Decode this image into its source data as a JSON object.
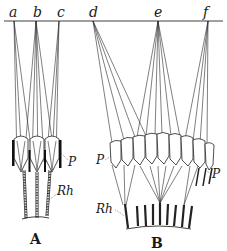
{
  "figure": {
    "type": "scientific-illustration",
    "point_labels": [
      "a",
      "b",
      "c",
      "d",
      "e",
      "f"
    ],
    "panels": [
      {
        "id": "A",
        "label": "A",
        "structures": [
          {
            "label": "P"
          },
          {
            "label": "Rh"
          }
        ]
      },
      {
        "id": "B",
        "label": "B",
        "structures": [
          {
            "label": "P"
          },
          {
            "label": "P"
          },
          {
            "label": "Rh"
          }
        ]
      }
    ]
  },
  "labels": {
    "a": "a",
    "b": "b",
    "c": "c",
    "d": "d",
    "e": "e",
    "f": "f",
    "A_P": "P",
    "A_Rh": "Rh",
    "A_panel": "A",
    "B_P_left": "P",
    "B_P_right": "P",
    "B_Rh": "Rh",
    "B_panel": "B"
  },
  "colors": {
    "ink": "#1a1a1a",
    "paper": "#ffffff"
  }
}
